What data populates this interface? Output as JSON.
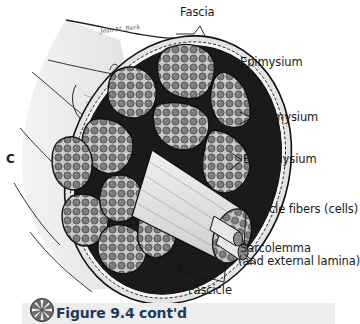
{
  "figure": {
    "panel_letter": "C",
    "signature": "Jean M. Beck",
    "labels": {
      "fascia": "Fascia",
      "epimysium": "Epimysium",
      "perimysium": "Perimysium",
      "endomysium": "Endomysium",
      "muscle_fibers": "Muscle fibers (cells)",
      "sarcolemma_line1": "Sarcolemma",
      "sarcolemma_line2": "(and external lamina)",
      "fascicle": "Fascicle"
    }
  },
  "caption": {
    "icon": "flower-badge-icon",
    "text": "Figure 9.4 cont'd",
    "bar_color": "#ecedef",
    "text_color": "#1d3a5c"
  }
}
